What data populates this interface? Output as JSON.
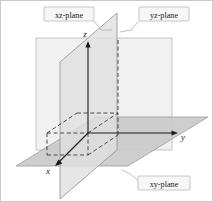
{
  "figure": {
    "background_color": "#ffffff",
    "border_color": "#c8c8c8"
  },
  "axes": [
    {
      "name": "x-axis",
      "label": "x",
      "label_x": 48,
      "label_y": 172,
      "direction": "toward viewer lower-left"
    },
    {
      "name": "y-axis",
      "label": "y",
      "label_x": 183,
      "label_y": 140,
      "direction": "right"
    },
    {
      "name": "z-axis",
      "label": "z",
      "label_x": 85,
      "label_y": 37,
      "direction": "up"
    }
  ],
  "planes": [
    {
      "name": "xz-plane",
      "label": "xz-plane",
      "fill": "#e3e3e3",
      "stroke": "#8a8a8a",
      "label_box": {
        "x": 44,
        "y": 7,
        "width": 50,
        "height": 14
      }
    },
    {
      "name": "yz-plane",
      "label": "yz-plane",
      "fill": "#eeeeee",
      "stroke": "#b4b4b4",
      "label_box": {
        "x": 139,
        "y": 7,
        "width": 50,
        "height": 14
      }
    },
    {
      "name": "xy-plane",
      "label": "xy-plane",
      "fill": "#c9c9c9",
      "stroke": "#9a9a9a",
      "label_box": {
        "x": 139,
        "y": 176,
        "width": 52,
        "height": 14
      }
    }
  ],
  "origin": {
    "x": 88,
    "y": 133,
    "label": ""
  },
  "colors": {
    "solid_line": "#1a1a1a",
    "dashed_line": "#3a3a3a",
    "label_box_fill": "#f7f7f7",
    "label_box_stroke": "#b0b0b0"
  }
}
